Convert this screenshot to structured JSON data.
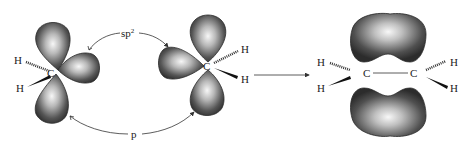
{
  "diagram": {
    "labels": {
      "hybrid": "sp",
      "hybrid_superscript": "2",
      "p_orbital": "p",
      "carbon": "C",
      "hydrogen": "H"
    },
    "left_molecule": {
      "carbon": "C",
      "h_top": "H",
      "h_bottom": "H"
    },
    "middle_molecule": {
      "carbon": "C",
      "h_top": "H",
      "h_bottom": "H"
    },
    "product": {
      "carbon_left": "C",
      "carbon_right": "C",
      "h_left_top": "H",
      "h_left_bottom": "H",
      "h_right_top": "H",
      "h_right_bottom": "H"
    },
    "colors": {
      "lobe_dark": "#3a3a3a",
      "lobe_light": "#f4f4f4",
      "line": "#333333"
    }
  }
}
